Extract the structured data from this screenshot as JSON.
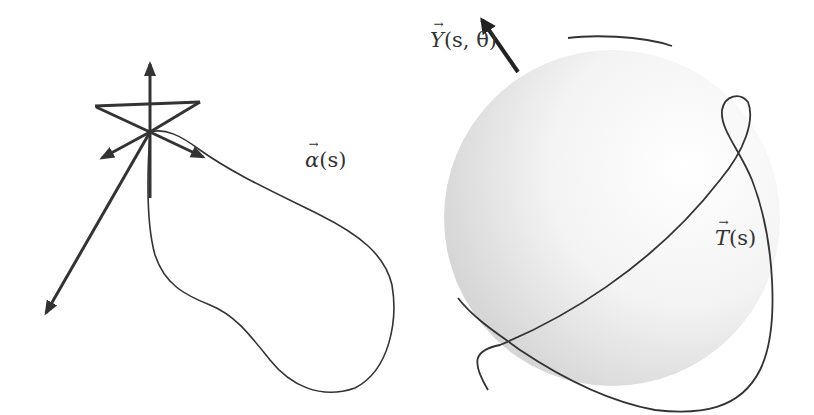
{
  "figure": {
    "left_panel": {
      "curve_label": {
        "symbol": "α",
        "args": "(s)"
      },
      "description": "closed space curve with orthonormal frame of arrows at a point"
    },
    "right_panel": {
      "vector_label": {
        "symbol": "Y",
        "args": "(s, θ)"
      },
      "curve_label": {
        "symbol": "T",
        "args": "(s)"
      },
      "description": "unit sphere with tangent indicatrix curve drawn on it"
    },
    "colors": {
      "stroke": "#333333",
      "sphere_fill_edge": "#d9d9d9",
      "sphere_fill_center": "#ffffff",
      "background": "#ffffff"
    }
  }
}
